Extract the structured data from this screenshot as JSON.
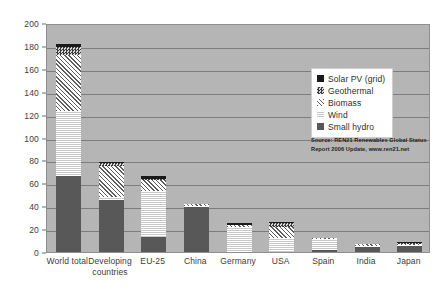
{
  "chart_data": {
    "type": "bar",
    "stacked": true,
    "title": "",
    "xlabel": "",
    "ylabel": "",
    "ylim": [
      0,
      200
    ],
    "ytick_step": 20,
    "yticks": [
      0,
      20,
      40,
      60,
      80,
      100,
      120,
      140,
      160,
      180,
      200
    ],
    "grid": true,
    "legend_position": "inside-top-right",
    "categories": [
      "World total",
      "Developing countries",
      "EU-25",
      "China",
      "Germany",
      "USA",
      "Spain",
      "India",
      "Japan"
    ],
    "series": [
      {
        "name": "Small hydro",
        "key": "smallhydro",
        "values": [
          66,
          45,
          13,
          39,
          0,
          0,
          1.5,
          4,
          5.5
        ]
      },
      {
        "name": "Wind",
        "key": "wind",
        "values": [
          57,
          3,
          40,
          1,
          22,
          12,
          9.5,
          1.5,
          0.5
        ]
      },
      {
        "name": "Biomass",
        "key": "biomass",
        "values": [
          49,
          27,
          10,
          2,
          2,
          10,
          0.5,
          1.5,
          0.5
        ]
      },
      {
        "name": "Geothermal",
        "key": "geothermal",
        "values": [
          7,
          3,
          1,
          0,
          0,
          3,
          0,
          0,
          0.5
        ]
      },
      {
        "name": "Solar PV (grid)",
        "key": "solarpv",
        "values": [
          3,
          1,
          2,
          0,
          1.5,
          0.5,
          0,
          0,
          0.5
        ]
      }
    ],
    "totals": [
      182,
      79,
      66,
      42,
      25.5,
      25.5,
      11.5,
      7,
      7
    ],
    "annotations": [
      "Source: REN21 Renewables Global Status",
      "Report 2006 Update, www.ren21.net"
    ]
  },
  "legend": {
    "items": [
      {
        "label": "Solar PV (grid)",
        "key": "solarpv",
        "swatch": "solid-black"
      },
      {
        "label": "Geothermal",
        "key": "geothermal",
        "swatch": "checkered"
      },
      {
        "label": "Biomass",
        "key": "biomass",
        "swatch": "diagonal-hatch"
      },
      {
        "label": "Wind",
        "key": "wind",
        "swatch": "horizontal-lines"
      },
      {
        "label": "Small hydro",
        "key": "smallhydro",
        "swatch": "solid-dark-gray"
      }
    ]
  },
  "source": {
    "line1": "Source: REN21 Renewables Global Status",
    "line2": "Report 2006 Update, www.ren21.net"
  },
  "colors": {
    "plot_background": "#b5b5b5",
    "gridline": "#7d7d7d",
    "axis_text": "#3c3c3c",
    "solarpv": "#1a1a1a",
    "geothermal": "#4a4a4a",
    "biomass": "#ffffff",
    "wind": "#f2f2f2",
    "smallhydro": "#585858"
  }
}
